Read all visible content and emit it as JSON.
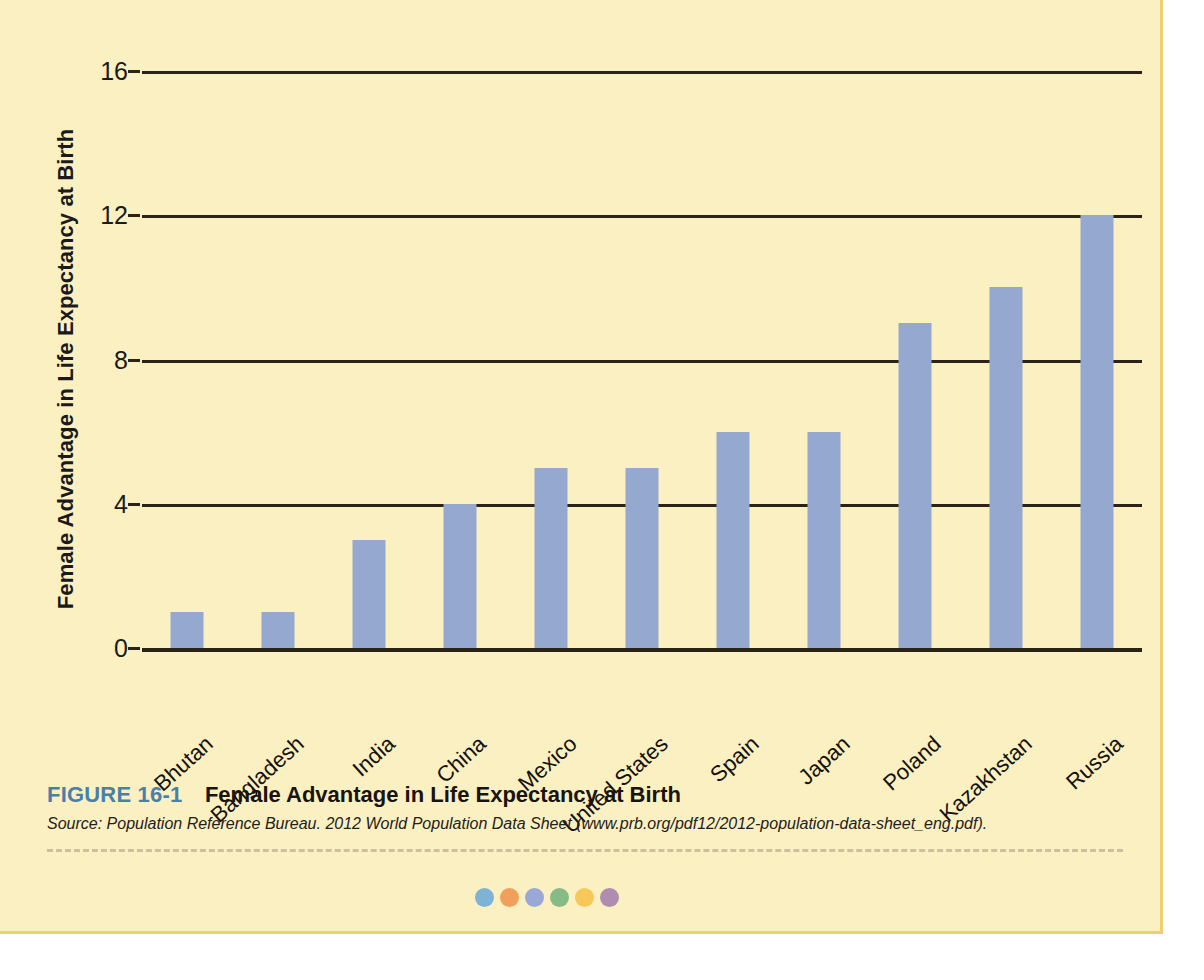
{
  "figure": {
    "number_label": "FIGURE 16-1",
    "title": "Female Advantage in Life Expectancy at Birth",
    "source": "Source: Population Reference Bureau. 2012 World Population Data Sheet (www.prb.org/pdf12/2012-population-data-sheet_eng.pdf)."
  },
  "colors": {
    "panel_background": "#faf0c2",
    "panel_border": "#f0cf70",
    "bar_fill": "#95a8d0",
    "axis_line": "#2b2218",
    "figure_number": "#4a7fa8",
    "dashed_rule": "#cbc0a0"
  },
  "decorative_dots": [
    {
      "name": "dot-teal",
      "color": "#7fb3d5"
    },
    {
      "name": "dot-orange",
      "color": "#f0a05a"
    },
    {
      "name": "dot-periwinkle",
      "color": "#9aa8d8"
    },
    {
      "name": "dot-green",
      "color": "#86bb87"
    },
    {
      "name": "dot-yellow",
      "color": "#f5c košík"
    },
    {
      "name": "dot-mauve",
      "color": "#b08cb0"
    }
  ],
  "chart_data": {
    "type": "bar",
    "title": "Female Advantage in Life Expectancy at Birth",
    "xlabel": "",
    "ylabel": "Female Advantage in Life Expectancy at Birth",
    "ylim": [
      0,
      16
    ],
    "yticks": [
      0,
      4,
      8,
      12,
      16
    ],
    "ytick_labels": [
      "0",
      "4",
      "8",
      "12",
      "16"
    ],
    "grid": true,
    "legend": false,
    "categories": [
      "Bhutan",
      "Bangladesh",
      "India",
      "China",
      "Mexico",
      "United States",
      "Spain",
      "Japan",
      "Poland",
      "Kazakhstan",
      "Russia"
    ],
    "values": [
      1,
      1,
      3,
      4,
      5,
      5,
      6,
      6,
      9,
      10,
      12
    ]
  }
}
